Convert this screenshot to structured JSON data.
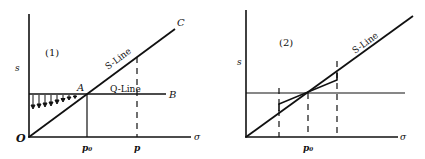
{
  "panels": [
    {
      "id": "1",
      "number_label": "(1)",
      "y_axis_label": "s",
      "x_axis_label": "σ",
      "origin_label": "O",
      "s_line_label": "S-Line",
      "q_line_label": "Q-Line",
      "point_a_label": "A",
      "point_b_label": "B",
      "point_c_label": "C",
      "tick_p0_label": "p₀",
      "tick_p_label": "p"
    },
    {
      "id": "2",
      "number_label": "(2)",
      "y_axis_label": "s",
      "x_axis_label": "σ",
      "s_line_label": "S-Line",
      "tick_p0_label": "p₀"
    }
  ],
  "colors": {
    "line": "#111111",
    "background": "#ffffff"
  }
}
